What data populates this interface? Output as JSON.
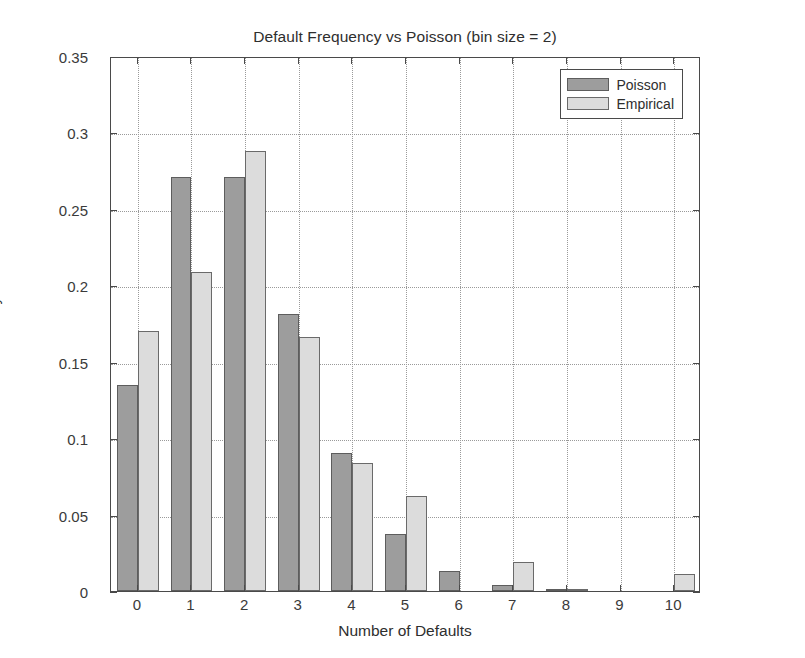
{
  "chart_data": {
    "type": "bar",
    "title": "Default Frequency vs Poisson (bin size = 2)",
    "xlabel": "Number of Defaults",
    "ylabel": "Probability",
    "categories": [
      "0",
      "1",
      "2",
      "3",
      "4",
      "5",
      "6",
      "7",
      "8",
      "9",
      "10"
    ],
    "series": [
      {
        "name": "Poisson",
        "color": "#9d9d9d",
        "values": [
          0.135,
          0.271,
          0.271,
          0.181,
          0.09,
          0.037,
          0.013,
          0.004,
          0.001,
          0.0,
          0.0
        ]
      },
      {
        "name": "Empirical",
        "color": "#dcdcdc",
        "values": [
          0.17,
          0.209,
          0.288,
          0.166,
          0.084,
          0.062,
          0.0,
          0.019,
          0.001,
          0.0,
          0.011
        ]
      }
    ],
    "ylim": [
      0,
      0.35
    ],
    "yticks": [
      0,
      0.05,
      0.1,
      0.15,
      0.2,
      0.25,
      0.3,
      0.35
    ],
    "ytick_labels": [
      "0",
      "0.05",
      "0.1",
      "0.15",
      "0.2",
      "0.25",
      "0.3",
      "0.35"
    ],
    "xtick_labels": [
      "0",
      "1",
      "2",
      "3",
      "4",
      "5",
      "6",
      "7",
      "8",
      "9",
      "10"
    ],
    "grid": true,
    "legend_position": "top-right",
    "legend_entries": [
      "Poisson",
      "Empirical"
    ]
  },
  "legend": {
    "items": [
      {
        "label": "Poisson"
      },
      {
        "label": "Empirical"
      }
    ]
  }
}
